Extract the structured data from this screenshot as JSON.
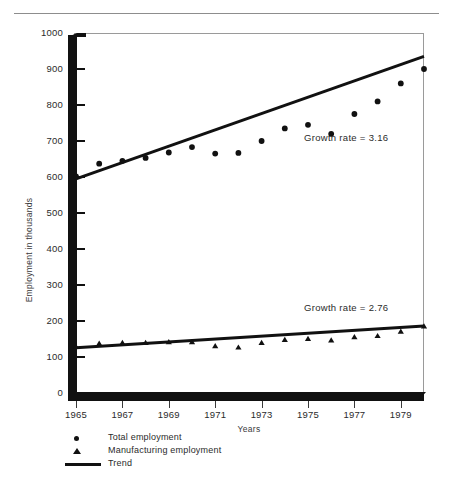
{
  "figure": {
    "cropped_caption": "",
    "axis_label_y": "Employment in thousands",
    "axis_label_x": "Years"
  },
  "legend": {
    "items": [
      {
        "marker": "circle-marker-icon",
        "label": "Total employment"
      },
      {
        "marker": "triangle-marker-icon",
        "label": "Manufacturing employment"
      },
      {
        "marker": "trend-line-icon",
        "label": "Trend"
      }
    ]
  },
  "annotations": [
    {
      "name": "growth-rate-total",
      "text": "Growth rate = 3.16"
    },
    {
      "name": "growth-rate-manufacturing",
      "text": "Growth rate = 2.76"
    }
  ],
  "chart_data": {
    "type": "scatter",
    "title": "",
    "xlabel": "Years",
    "ylabel": "Employment in thousands",
    "xlim": [
      1965,
      1980
    ],
    "ylim": [
      0,
      1000
    ],
    "grid": false,
    "legend_position": "below-axes-left",
    "y_ticks": [
      0,
      100,
      200,
      300,
      400,
      500,
      600,
      700,
      800,
      900,
      1000
    ],
    "y_tick_labels": [
      "0",
      "100",
      "200",
      "300",
      "400",
      "500",
      "600",
      "700",
      "800",
      "900",
      "1000"
    ],
    "x_ticks": [
      1965,
      1967,
      1969,
      1971,
      1973,
      1975,
      1977,
      1979
    ],
    "x_tick_labels": [
      "1965",
      "1967",
      "1969",
      "1971",
      "1973",
      "1975",
      "1977",
      "1979"
    ],
    "x": [
      1965,
      1966,
      1967,
      1968,
      1969,
      1970,
      1971,
      1972,
      1973,
      1974,
      1975,
      1976,
      1977,
      1978,
      1979,
      1980
    ],
    "series": [
      {
        "name": "Total employment",
        "marker": "circle",
        "color": "#111111",
        "values": [
          602,
          637,
          645,
          653,
          668,
          683,
          665,
          667,
          700,
          735,
          745,
          720,
          775,
          810,
          860,
          900
        ]
      },
      {
        "name": "Manufacturing employment",
        "marker": "triangle",
        "color": "#111111",
        "values": [
          128,
          137,
          139,
          139,
          141,
          141,
          130,
          126,
          139,
          147,
          150,
          146,
          155,
          158,
          170,
          185
        ]
      }
    ],
    "trends": [
      {
        "name": "Trend total employment",
        "growth_rate": 3.16,
        "color": "#111111",
        "x_start": 1965,
        "y_start": 595,
        "x_end": 1980,
        "y_end": 935
      },
      {
        "name": "Trend manufacturing employment",
        "growth_rate": 2.76,
        "color": "#111111",
        "x_start": 1965,
        "y_start": 126,
        "x_end": 1980,
        "y_end": 186
      }
    ]
  }
}
